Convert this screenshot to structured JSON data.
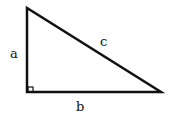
{
  "diagram": {
    "type": "right-triangle",
    "labels": {
      "vertical_side": "a",
      "horizontal_side": "b",
      "hypotenuse": "c"
    },
    "right_angle_marker": true,
    "colors": {
      "stroke": "#111111",
      "background": "#ffffff"
    }
  }
}
